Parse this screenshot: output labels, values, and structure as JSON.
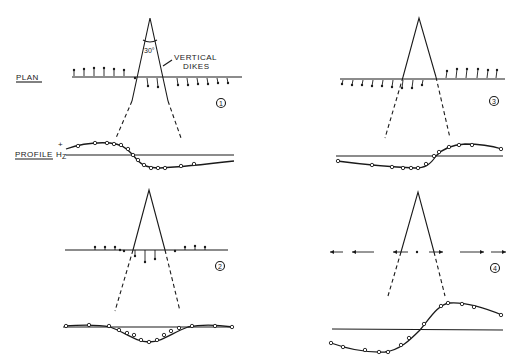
{
  "labels": {
    "plan": "PLAN",
    "profile": "PROFILE",
    "hz": "H",
    "hz_sub": "Z",
    "plus": "+",
    "angle": "30°",
    "vertical": "VERTICAL",
    "dikes": "DIKES"
  },
  "panels": [
    {
      "id": "1",
      "label": "1",
      "description": "Dikes with magnetization; plan vectors point up-left on left side and down on right side; profile positive on left, negative on right"
    },
    {
      "id": "2",
      "label": "2",
      "description": "Symmetric case; small vectors outside, downward vectors between dikes; profile negative trough at center"
    },
    {
      "id": "3",
      "label": "3",
      "description": "Plan vectors point down on left, up on right; profile negative on left, positive on right"
    },
    {
      "id": "4",
      "label": "4",
      "description": "Horizontal vectors pointing outward; profile antisymmetric S-curve from negative to positive"
    }
  ],
  "colors": {
    "ink": "#1a1a1a",
    "background": "#ffffff"
  }
}
